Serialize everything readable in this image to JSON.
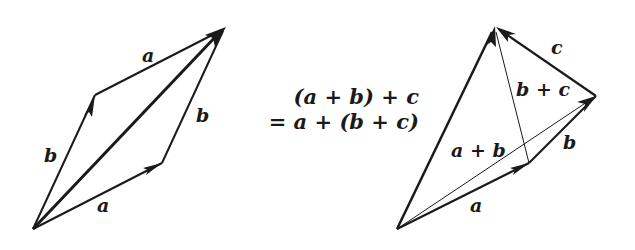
{
  "colors": {
    "background": "#ffffff",
    "stroke": "#1a1a1a"
  },
  "left_diagram": {
    "title": "Commutativity of vector addition (parallelogram law)",
    "points": {
      "origin": [
        33,
        229
      ],
      "b_tip": [
        95,
        95
      ],
      "a_tip": [
        162,
        163
      ],
      "sum_tip": [
        225,
        28
      ]
    },
    "labels": {
      "a_top": "a",
      "b_right": "b",
      "b_left": "b",
      "a_bottom": "a"
    }
  },
  "right_diagram": {
    "title": "Associativity of vector addition",
    "points": {
      "origin": [
        397,
        229
      ],
      "a_tip": [
        529,
        163
      ],
      "ab_tip": [
        596,
        96
      ],
      "apex": [
        495,
        27
      ]
    },
    "labels": {
      "c": "c",
      "b_plus_c": "b + c",
      "b": "b",
      "a_plus_b": "a + b",
      "a": "a"
    },
    "equation": {
      "line1": "(a + b) + c",
      "line2": "= a + (b + c)"
    }
  }
}
